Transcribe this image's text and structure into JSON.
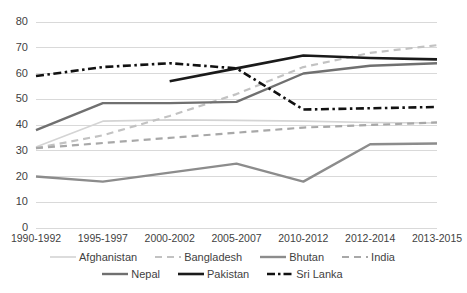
{
  "chart_data": {
    "type": "line",
    "title": "",
    "subtitle": "",
    "xlabel": "",
    "ylabel": "",
    "ylim": [
      0,
      80
    ],
    "ytick_step": 10,
    "grid": true,
    "legend_position": "bottom",
    "categories": [
      "1990-1992",
      "1995-1997",
      "2000-2002",
      "2005-2007",
      "2010-2012",
      "2012-2014",
      "2013-2015"
    ],
    "yticks": [
      "0",
      "10",
      "20",
      "30",
      "40",
      "50",
      "60",
      "70",
      "80"
    ],
    "series": [
      {
        "name": "Afghanistan",
        "color": "#d4d4d4",
        "style": "solid",
        "width": 1.6,
        "values": [
          31.5,
          41.5,
          42.0,
          41.8,
          41.5,
          41.0,
          40.8
        ]
      },
      {
        "name": "Bangladesh",
        "color": "#c2c2c2",
        "style": "dashed",
        "width": 2.2,
        "values": [
          31.0,
          36.0,
          43.5,
          52.0,
          62.5,
          68.0,
          71.0
        ]
      },
      {
        "name": "Bhutan",
        "color": "#8c8c8c",
        "style": "solid",
        "width": 2.4,
        "values": [
          20.0,
          18.0,
          21.5,
          25.0,
          18.0,
          32.5,
          32.8
        ]
      },
      {
        "name": "India",
        "color": "#a8a8a8",
        "style": "dashed",
        "width": 2.2,
        "values": [
          31.0,
          33.0,
          35.0,
          37.0,
          39.0,
          40.0,
          41.0
        ]
      },
      {
        "name": "Nepal",
        "color": "#707070",
        "style": "solid",
        "width": 2.4,
        "values": [
          38.0,
          48.5,
          48.5,
          49.0,
          60.0,
          63.0,
          64.0
        ]
      },
      {
        "name": "Pakistan",
        "color": "#1a1a1a",
        "style": "solid",
        "width": 2.6,
        "values": [
          null,
          null,
          57.0,
          62.0,
          67.0,
          66.0,
          65.5
        ]
      },
      {
        "name": "Sri Lanka",
        "color": "#111111",
        "style": "dash-dot",
        "width": 2.6,
        "values": [
          59.0,
          62.5,
          64.0,
          62.0,
          46.0,
          46.5,
          47.0
        ]
      }
    ]
  },
  "legend": {
    "rows": [
      [
        "Afghanistan",
        "Bangladesh",
        "Bhutan",
        "India"
      ],
      [
        "Nepal",
        "Pakistan",
        "Sri Lanka"
      ]
    ]
  }
}
